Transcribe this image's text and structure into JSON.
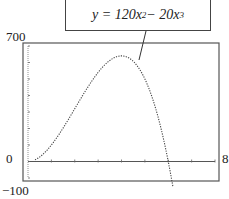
{
  "chart_data": {
    "type": "line",
    "title": "",
    "equation_label": "y = 120x^2 - 20x^3",
    "xlabel": "",
    "ylabel": "",
    "xlim": [
      0,
      8
    ],
    "ylim": [
      -100,
      700
    ],
    "x_tick_labels": {
      "left": "0",
      "right": "8"
    },
    "y_tick_labels": {
      "top": "700",
      "bottom": "-100"
    },
    "x_ticks_count": 8,
    "y_ticks_count": 8,
    "grid": false,
    "series": [
      {
        "name": "y = 120x^2 - 20x^3",
        "style": "dotted",
        "x": [
          0,
          0.5,
          1,
          1.5,
          2,
          2.5,
          3,
          3.5,
          4,
          4.5,
          5,
          5.5,
          6,
          6.2
        ],
        "values": [
          0,
          27.5,
          100,
          202.5,
          320,
          437.5,
          540,
          612.5,
          640,
          607.5,
          500,
          302.5,
          0,
          -97.6
        ]
      }
    ]
  },
  "labels": {
    "y_top": "700",
    "y_zero": "0",
    "y_bottom": "−100",
    "x_right": "8"
  },
  "callout": {
    "prefix": "y = 120x",
    "exp1": "2",
    "mid": " − 20x",
    "exp2": "3"
  }
}
